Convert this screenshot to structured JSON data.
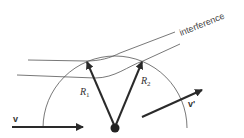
{
  "diagram": {
    "labels": {
      "interference": "interference",
      "r1": "R",
      "r1_sub": "1",
      "r2": "R",
      "r2_sub": "2",
      "v": "v",
      "v_prime": "v'"
    },
    "colors": {
      "stroke": "#2a2a2a",
      "thin": "#555555",
      "text": "#444444"
    }
  }
}
